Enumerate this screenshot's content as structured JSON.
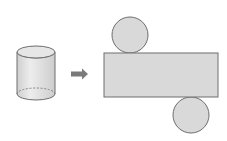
{
  "diagram": {
    "colors": {
      "fill": "#d9d9d9",
      "stroke": "#6e6e6e",
      "arrow": "#7a7a7a",
      "cylinder_highlight": "#efefef",
      "background": "#ffffff"
    },
    "cylinder": {
      "cx": 36,
      "top_y": 52,
      "bottom_y": 94,
      "rx": 19,
      "ry": 6,
      "hidden_edge": "dashed"
    },
    "arrow": {
      "x1": 71,
      "x2": 88,
      "y": 74,
      "direction": "right"
    },
    "net": {
      "rectangle": {
        "x": 104,
        "y": 53,
        "width": 114,
        "height": 44
      },
      "top_circle": {
        "cx": 130,
        "cy": 35,
        "r": 18
      },
      "bottom_circle": {
        "cx": 191,
        "cy": 115,
        "r": 18
      }
    }
  }
}
